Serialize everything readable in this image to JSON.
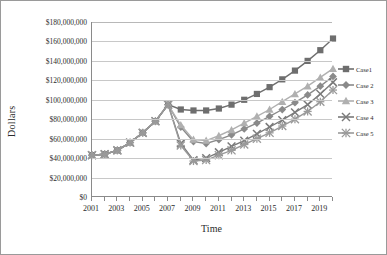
{
  "chart_data": {
    "type": "line",
    "title": "",
    "xlabel": "Time",
    "ylabel": "Dollars",
    "xlim": [
      2001,
      2020
    ],
    "ylim": [
      0,
      180000000
    ],
    "grid": true,
    "legend_position": "right",
    "x": [
      2001,
      2002,
      2003,
      2004,
      2005,
      2006,
      2007,
      2008,
      2009,
      2010,
      2011,
      2012,
      2013,
      2014,
      2015,
      2016,
      2017,
      2018,
      2019,
      2020
    ],
    "ytick_labels": [
      "$180,000,000",
      "$160,000,000",
      "$140,000,000",
      "$120,000,000",
      "$100,000,000",
      "$80,000,000",
      "$60,000,000",
      "$40,000,000",
      "$20,000,000",
      "$0"
    ],
    "ytick_values": [
      180000000,
      160000000,
      140000000,
      120000000,
      100000000,
      80000000,
      60000000,
      40000000,
      20000000,
      0
    ],
    "xtick_labels": [
      "2001",
      "2003",
      "2005",
      "2007",
      "2009",
      "2011",
      "2013",
      "2015",
      "2017",
      "2019"
    ],
    "xtick_values": [
      2001,
      2003,
      2005,
      2007,
      2009,
      2011,
      2013,
      2015,
      2017,
      2019
    ],
    "series": [
      {
        "name": "Case1",
        "marker": "square",
        "color": "#6e6e6e",
        "values": [
          43000000,
          44000000,
          48000000,
          56000000,
          66000000,
          78000000,
          95000000,
          90000000,
          89000000,
          89000000,
          91000000,
          95000000,
          100000000,
          106000000,
          113000000,
          121000000,
          130000000,
          140000000,
          151000000,
          163000000
        ]
      },
      {
        "name": "Case 2",
        "marker": "diamond",
        "color": "#8a8a8a",
        "values": [
          43000000,
          44000000,
          48000000,
          56000000,
          66000000,
          78000000,
          95000000,
          72000000,
          57000000,
          55000000,
          59000000,
          64000000,
          70000000,
          76000000,
          83000000,
          90000000,
          97000000,
          105000000,
          114000000,
          124000000
        ]
      },
      {
        "name": "Case 3",
        "marker": "triangle",
        "color": "#b0b0b0",
        "values": [
          43000000,
          44000000,
          48000000,
          56000000,
          66000000,
          78000000,
          95000000,
          74000000,
          59000000,
          58000000,
          63000000,
          69000000,
          76000000,
          83000000,
          90000000,
          98000000,
          106000000,
          114000000,
          123000000,
          132000000
        ]
      },
      {
        "name": "Case 4",
        "marker": "x",
        "color": "#7a7a7a",
        "values": [
          43000000,
          44000000,
          48000000,
          56000000,
          66000000,
          78000000,
          95000000,
          55000000,
          38000000,
          40000000,
          46000000,
          52000000,
          58000000,
          65000000,
          72000000,
          79000000,
          87000000,
          95000000,
          106000000,
          118000000
        ]
      },
      {
        "name": "Case 5",
        "marker": "star",
        "color": "#9a9a9a",
        "values": [
          43000000,
          44000000,
          48000000,
          56000000,
          66000000,
          78000000,
          95000000,
          53000000,
          37000000,
          38000000,
          43000000,
          48000000,
          54000000,
          60000000,
          66000000,
          73000000,
          80000000,
          88000000,
          98000000,
          110000000
        ]
      }
    ]
  }
}
